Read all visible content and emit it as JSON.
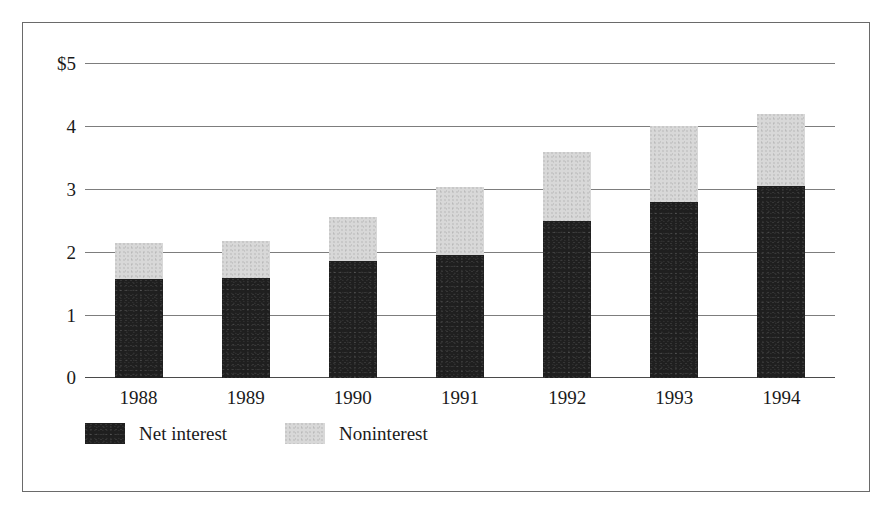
{
  "chart_data": {
    "type": "bar",
    "subtype": "stacked-vertical",
    "title": "",
    "subtitle": "",
    "xlabel": "",
    "ylabel": "",
    "categories": [
      "1988",
      "1989",
      "1990",
      "1991",
      "1992",
      "1993",
      "1994"
    ],
    "series": [
      {
        "name": "Net interest",
        "color": "#1f1f1f",
        "values": [
          1.57,
          1.58,
          1.85,
          1.96,
          2.49,
          2.8,
          3.04
        ]
      },
      {
        "name": "Noninterest",
        "color": "#d8d8d8",
        "values": [
          0.58,
          0.6,
          0.7,
          1.07,
          1.09,
          1.2,
          1.15
        ]
      }
    ],
    "totals": [
      2.15,
      2.18,
      2.55,
      3.03,
      3.58,
      4.0,
      4.19
    ],
    "ylim": [
      0,
      5
    ],
    "yticks": [
      0,
      1,
      2,
      3,
      4,
      5
    ],
    "ytick_labels": [
      "0",
      "1",
      "2",
      "3",
      "4",
      "$5"
    ],
    "grid": true,
    "grid_axis": "y",
    "legend_position": "bottom-left",
    "units": "dollars",
    "value_prefix": "$"
  },
  "legend": {
    "items": [
      {
        "label": "Net interest",
        "swatch": "dark-swatch"
      },
      {
        "label": "Noninterest",
        "swatch": "light-swatch"
      }
    ]
  },
  "colors": {
    "net_interest": "#1f1f1f",
    "noninterest": "#d8d8d8",
    "gridline": "#7d7d7d",
    "frame": "#6a6a6a",
    "background": "#ffffff",
    "text": "#1a1a1a"
  }
}
